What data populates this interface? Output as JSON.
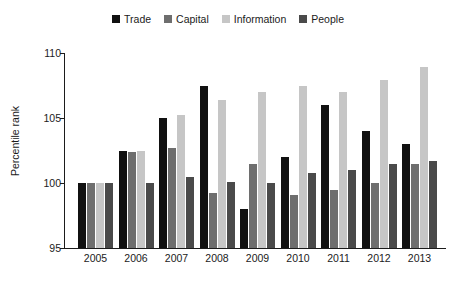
{
  "legend": {
    "entries": [
      {
        "label": "Trade",
        "color": "#111111"
      },
      {
        "label": "Capital",
        "color": "#6e6e6e"
      },
      {
        "label": "Information",
        "color": "#c6c6c6"
      },
      {
        "label": "People",
        "color": "#4a4a4a"
      }
    ]
  },
  "axes": {
    "y_title": "Percentile rank",
    "y_ticks": [
      "95",
      "100",
      "105",
      "110"
    ]
  },
  "chart_data": {
    "type": "bar",
    "title": "",
    "xlabel": "",
    "ylabel": "Percentile rank",
    "ylim": [
      95,
      110
    ],
    "yticks": [
      95,
      100,
      105,
      110
    ],
    "grid": false,
    "legend_position": "top-center",
    "categories": [
      "2005",
      "2006",
      "2007",
      "2008",
      "2009",
      "2010",
      "2011",
      "2012",
      "2013"
    ],
    "series": [
      {
        "name": "Trade",
        "color": "#111111",
        "values": [
          100.0,
          102.5,
          105.0,
          107.5,
          98.0,
          102.0,
          106.0,
          104.0,
          103.0
        ]
      },
      {
        "name": "Capital",
        "color": "#6e6e6e",
        "values": [
          100.0,
          102.4,
          102.7,
          99.2,
          101.5,
          99.1,
          99.5,
          100.0,
          101.5
        ]
      },
      {
        "name": "Information",
        "color": "#c6c6c6",
        "values": [
          100.0,
          102.5,
          105.2,
          106.4,
          107.0,
          107.5,
          107.0,
          107.9,
          108.9
        ]
      },
      {
        "name": "People",
        "color": "#4a4a4a",
        "values": [
          100.0,
          100.0,
          100.5,
          100.1,
          100.0,
          100.8,
          101.0,
          101.5,
          101.7
        ]
      }
    ]
  }
}
